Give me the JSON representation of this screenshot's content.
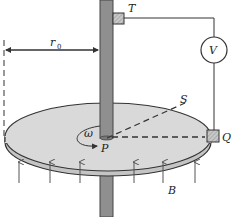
{
  "diagram": {
    "labels": {
      "radius": "r",
      "radius_sub": "0",
      "contact_top": "T",
      "voltmeter": "V",
      "rim_point": "S",
      "center": "P",
      "contact_rim": "Q",
      "angular_velocity": "ω",
      "field": "B"
    },
    "colors": {
      "disk_fill": "#d9d9d9",
      "disk_edge": "#bdbdbd",
      "axle_fill": "#8f8f8f",
      "line": "#333333",
      "contact_fill": "#bbbbbb"
    },
    "field_arrows_count": 6
  }
}
